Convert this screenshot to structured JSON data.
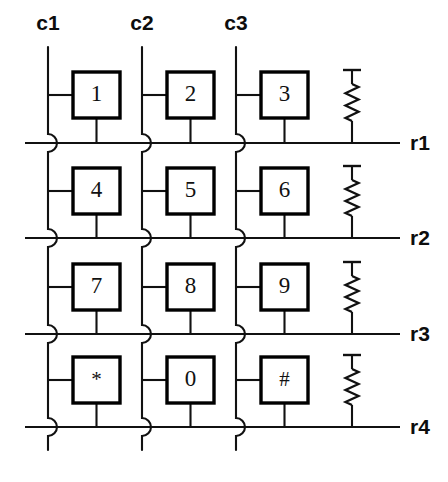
{
  "diagram": {
    "type": "circuit-schematic",
    "background_color": "#ffffff",
    "line_color": "#111111",
    "box_fill": "#ffffff",
    "box_stroke": "#000000"
  },
  "columns": [
    {
      "id": "c1",
      "label": "c1",
      "x": 48,
      "label_x": 48,
      "label_y": 30,
      "top_y": 47,
      "bottom_y": 450
    },
    {
      "id": "c2",
      "label": "c2",
      "x": 142,
      "label_x": 142,
      "label_y": 30,
      "top_y": 47,
      "bottom_y": 450
    },
    {
      "id": "c3",
      "label": "c3",
      "x": 236,
      "label_x": 236,
      "label_y": 30,
      "top_y": 47,
      "bottom_y": 450
    }
  ],
  "rows": [
    {
      "id": "r1",
      "label": "r1",
      "y": 143,
      "label_x": 410,
      "x_start": 25,
      "x_end": 400
    },
    {
      "id": "r2",
      "label": "r2",
      "y": 238,
      "label_x": 410,
      "x_start": 25,
      "x_end": 400
    },
    {
      "id": "r3",
      "label": "r3",
      "y": 334,
      "label_x": 410,
      "x_start": 25,
      "x_end": 400
    },
    {
      "id": "r4",
      "label": "r4",
      "y": 427,
      "label_x": 410,
      "x_start": 25,
      "x_end": 400
    }
  ],
  "keys": [
    {
      "label": "1",
      "row": "r1",
      "col": "c1",
      "box_x": 73,
      "box_y": 72,
      "w": 47,
      "h": 46
    },
    {
      "label": "2",
      "row": "r1",
      "col": "c2",
      "box_x": 167,
      "box_y": 72,
      "w": 47,
      "h": 46
    },
    {
      "label": "3",
      "row": "r1",
      "col": "c3",
      "box_x": 261,
      "box_y": 72,
      "w": 47,
      "h": 46
    },
    {
      "label": "4",
      "row": "r2",
      "col": "c1",
      "box_x": 73,
      "box_y": 168,
      "w": 47,
      "h": 46
    },
    {
      "label": "5",
      "row": "r2",
      "col": "c2",
      "box_x": 167,
      "box_y": 168,
      "w": 47,
      "h": 46
    },
    {
      "label": "6",
      "row": "r2",
      "col": "c3",
      "box_x": 261,
      "box_y": 168,
      "w": 47,
      "h": 46
    },
    {
      "label": "7",
      "row": "r3",
      "col": "c1",
      "box_x": 73,
      "box_y": 264,
      "w": 47,
      "h": 46
    },
    {
      "label": "8",
      "row": "r3",
      "col": "c2",
      "box_x": 167,
      "box_y": 264,
      "w": 47,
      "h": 46
    },
    {
      "label": "9",
      "row": "r3",
      "col": "c3",
      "box_x": 261,
      "box_y": 264,
      "w": 47,
      "h": 46
    },
    {
      "label": "*",
      "row": "r4",
      "col": "c1",
      "box_x": 73,
      "box_y": 357,
      "w": 47,
      "h": 46
    },
    {
      "label": "0",
      "row": "r4",
      "col": "c2",
      "box_x": 167,
      "box_y": 357,
      "w": 47,
      "h": 46
    },
    {
      "label": "#",
      "row": "r4",
      "col": "c3",
      "box_x": 261,
      "box_y": 357,
      "w": 47,
      "h": 46
    }
  ],
  "resistors": [
    {
      "id": "rp1",
      "row": "r1",
      "x": 352,
      "cap_y": 70,
      "bottom_y": 143
    },
    {
      "id": "rp2",
      "row": "r2",
      "x": 352,
      "cap_y": 166,
      "bottom_y": 238
    },
    {
      "id": "rp3",
      "row": "r3",
      "x": 352,
      "cap_y": 262,
      "bottom_y": 334
    },
    {
      "id": "rp4",
      "row": "r4",
      "x": 352,
      "cap_y": 355,
      "bottom_y": 427
    }
  ],
  "notes": {
    "wire_hop_style": "semicircular bump bulging right where column crosses row",
    "key_count": 12,
    "column_count": 3,
    "row_count": 4
  }
}
